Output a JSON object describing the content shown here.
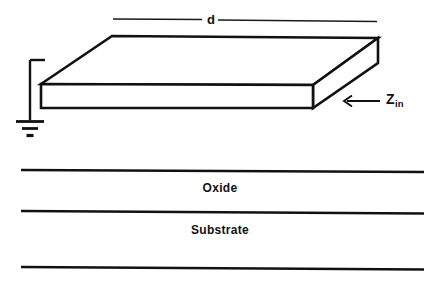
{
  "diagram": {
    "type": "cross-section-schematic",
    "background_color": "#ffffff",
    "line_color": "#111111",
    "labels": {
      "length_dimension": "d",
      "impedance_symbol": "Z",
      "impedance_subscript": "in",
      "oxide_layer": "Oxide",
      "substrate_layer": "Substrate"
    },
    "icons": {
      "ground": "ground-symbol",
      "impedance_arrow": "left-arrow-icon"
    },
    "geometry": {
      "slab": {
        "front_face": {
          "x1": 41,
          "y1": 84,
          "x2": 313,
          "y2": 108
        },
        "top_face_back_left": {
          "x": 112,
          "y": 36
        },
        "top_face_back_right": {
          "x": 378,
          "y": 38
        },
        "depth_offset_x": 66,
        "depth_offset_y": -46
      },
      "ground_wire": {
        "x": 30,
        "top_y": 60,
        "bottom_y": 120
      },
      "ground_bars": [
        {
          "half_width": 14,
          "y": 121,
          "thickness": 2.6
        },
        {
          "half_width": 8,
          "y": 128,
          "thickness": 2.6
        },
        {
          "half_width": 3.5,
          "y": 135,
          "thickness": 3.0
        }
      ],
      "dimension_line": {
        "y": 19,
        "left_segment": {
          "x1": 113,
          "x2": 202
        },
        "right_segment": {
          "x1": 218,
          "x2": 377
        }
      },
      "impedance_arrow": {
        "y": 101,
        "tail_x": 380,
        "head_x": 345
      },
      "layer_lines": [
        {
          "x1": 21,
          "x2": 424,
          "y": 170
        },
        {
          "x1": 21,
          "x2": 424,
          "y": 212
        },
        {
          "x1": 21,
          "x2": 424,
          "y": 268
        }
      ]
    }
  }
}
